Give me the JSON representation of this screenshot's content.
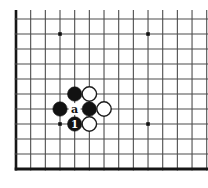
{
  "diagram": {
    "board_section": "bottom-left-corner",
    "colors": {
      "background": "#ffffff",
      "grid_line": "#4d4d4d",
      "board_edge": "#161616",
      "black_stone": "#121212",
      "white_stone": "#ffffff",
      "stone_outline": "#1c1c1c",
      "star_point": "#111111",
      "label_on_board": "#111111",
      "label_on_stone": "#ffffff"
    },
    "geometry": {
      "cols": 14,
      "rows": 11,
      "x_start": 16,
      "top_line_y": 19,
      "col_spacing": 14.67,
      "row_spacing": 15,
      "v_line_top_cut_y": 10,
      "right_cut_x": 208,
      "edge_left_width": 2.6,
      "edge_bottom_width": 3,
      "inner_line_width": 1.1,
      "stone_radius": 7.2,
      "white_stroke_width": 1.4,
      "star_size": 3.6
    },
    "star_points": [
      {
        "col": 4,
        "row": 2
      },
      {
        "col": 10,
        "row": 2
      },
      {
        "col": 4,
        "row": 8
      },
      {
        "col": 10,
        "row": 8
      }
    ],
    "stones": [
      {
        "color": "black",
        "col": 5,
        "row": 6,
        "label": ""
      },
      {
        "color": "white",
        "col": 6,
        "row": 6,
        "label": ""
      },
      {
        "color": "black",
        "col": 4,
        "row": 7,
        "label": ""
      },
      {
        "color": "black",
        "col": 6,
        "row": 7,
        "label": ""
      },
      {
        "color": "white",
        "col": 7,
        "row": 7,
        "label": ""
      },
      {
        "color": "black",
        "col": 5,
        "row": 8,
        "label": "1"
      },
      {
        "color": "white",
        "col": 6,
        "row": 8,
        "label": ""
      }
    ],
    "point_labels": [
      {
        "text": "a",
        "col": 5,
        "row": 7
      }
    ]
  }
}
